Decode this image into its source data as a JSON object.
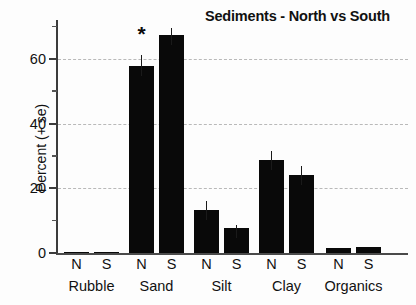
{
  "chart_data": {
    "type": "bar",
    "title": "Sediments - North vs South",
    "xlabel": "",
    "ylabel": "Percent (+ se)",
    "categories": [
      "Rubble",
      "Sand",
      "Silt",
      "Clay",
      "Organics"
    ],
    "subcategories": [
      "N",
      "S"
    ],
    "series": [
      {
        "name": "N",
        "values": [
          0.3,
          57.8,
          13.2,
          28.6,
          1.6
        ]
      },
      {
        "name": "S",
        "values": [
          0.2,
          67.4,
          7.7,
          24.0,
          1.7
        ]
      }
    ],
    "errors": [
      {
        "name": "N",
        "values": [
          0.0,
          3.5,
          3.0,
          2.8,
          0.0
        ]
      },
      {
        "name": "S",
        "values": [
          0.0,
          2.0,
          0.9,
          3.0,
          0.0
        ]
      }
    ],
    "annotations": [
      {
        "text": "*",
        "category": "Sand",
        "subcategory": "N",
        "meaning": "significance-marker"
      }
    ],
    "ylim": [
      0,
      72
    ],
    "yticks_major": [
      0,
      20,
      40,
      60
    ],
    "yticks_major_labels": [
      "0",
      "20",
      "40",
      "60"
    ],
    "yticks_minor": [
      10,
      30,
      50,
      70
    ],
    "grid": "horizontal-dashed",
    "legend": "none",
    "bar_color": "#090909"
  },
  "axis": {
    "y_label": "Percent (+ se)"
  }
}
